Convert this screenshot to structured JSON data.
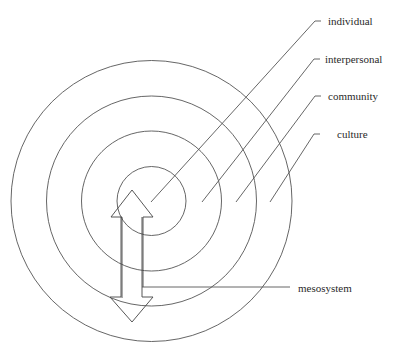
{
  "diagram": {
    "center": {
      "x": 151,
      "y": 201
    },
    "rings": [
      {
        "name": "individual",
        "radius": 35
      },
      {
        "name": "interpersonal",
        "radius": 70
      },
      {
        "name": "community",
        "radius": 105
      },
      {
        "name": "culture",
        "radius": 140
      }
    ],
    "labels": {
      "individual": "individual",
      "interpersonal": "interpersonal",
      "community": "community",
      "culture": "culture",
      "mesosystem": "mesosystem"
    },
    "colors": {
      "stroke": "#555555",
      "text": "#2a2a2a",
      "background": "#ffffff"
    }
  }
}
